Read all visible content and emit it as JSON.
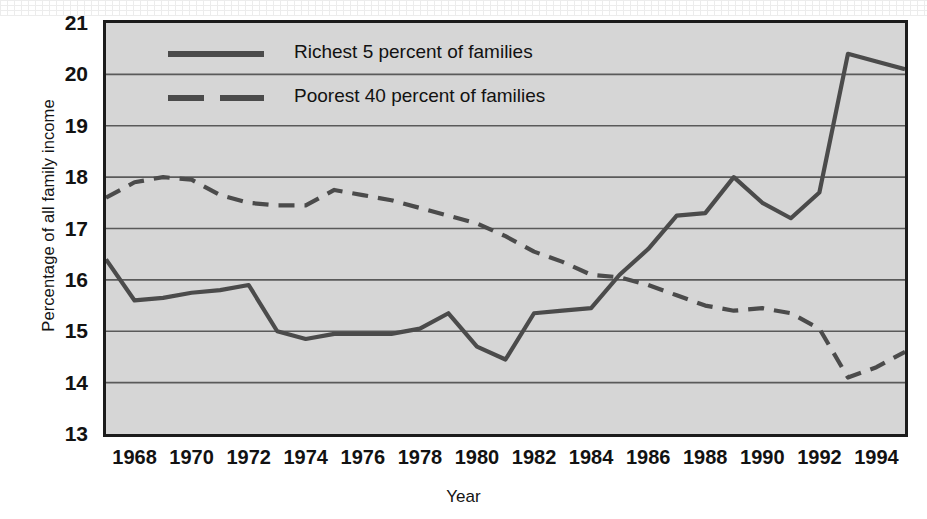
{
  "chart_data": {
    "type": "line",
    "title": "",
    "xlabel": "Year",
    "ylabel": "Percentage of all family income",
    "xlim": [
      1967,
      1995
    ],
    "ylim": [
      13,
      21
    ],
    "grid": true,
    "grid_axis": "y",
    "legend_position": "top-left-inside",
    "y_ticks": [
      21,
      20,
      19,
      18,
      17,
      16,
      15,
      14,
      13
    ],
    "x_ticks": [
      1968,
      1970,
      1972,
      1974,
      1976,
      1978,
      1980,
      1982,
      1984,
      1986,
      1988,
      1990,
      1992,
      1994
    ],
    "x": [
      1967,
      1968,
      1969,
      1970,
      1971,
      1972,
      1973,
      1974,
      1975,
      1976,
      1977,
      1978,
      1979,
      1980,
      1981,
      1982,
      1983,
      1984,
      1985,
      1986,
      1987,
      1988,
      1989,
      1990,
      1991,
      1992,
      1993,
      1994,
      1995
    ],
    "series": [
      {
        "name": "Richest 5 percent of families",
        "style": "solid",
        "color": "#4b4b4b",
        "values": [
          16.4,
          15.6,
          15.65,
          15.75,
          15.8,
          15.9,
          15.0,
          14.85,
          14.95,
          14.95,
          14.95,
          15.05,
          15.35,
          14.7,
          14.45,
          15.35,
          15.4,
          15.45,
          16.1,
          16.6,
          17.25,
          17.3,
          18.0,
          17.5,
          17.2,
          17.7,
          20.4,
          20.25,
          20.1
        ]
      },
      {
        "name": "Poorest 40 percent of families",
        "style": "dashed",
        "color": "#4b4b4b",
        "values": [
          17.6,
          17.9,
          18.0,
          17.95,
          17.65,
          17.5,
          17.45,
          17.45,
          17.75,
          17.65,
          17.55,
          17.4,
          17.25,
          17.1,
          16.85,
          16.55,
          16.35,
          16.1,
          16.05,
          15.9,
          15.7,
          15.5,
          15.4,
          15.45,
          15.35,
          15.05,
          14.1,
          14.3,
          14.6
        ]
      }
    ]
  },
  "legend": {
    "items": [
      {
        "label": "Richest 5 percent of families",
        "style": "solid"
      },
      {
        "label": "Poorest 40 percent of families",
        "style": "dashed"
      }
    ]
  },
  "axes": {
    "y_title": "Percentage of all family income",
    "x_title": "Year"
  }
}
